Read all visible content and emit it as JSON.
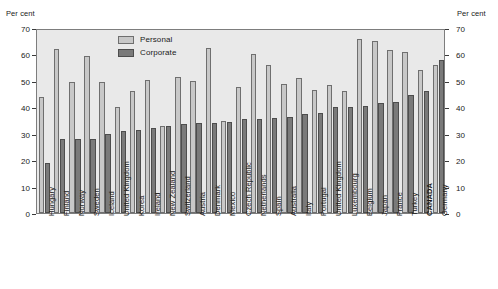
{
  "axis": {
    "unit_label_left": "Per cent",
    "unit_label_right": "Per cent",
    "ticks": [
      0,
      10,
      20,
      30,
      40,
      50,
      60,
      70
    ]
  },
  "legend": {
    "entries": [
      {
        "label": "Personal",
        "color": "#c8c8c8",
        "key": "personal"
      },
      {
        "label": "Corporate",
        "color": "#7a7a7a",
        "key": "corporate"
      }
    ]
  },
  "chart_data": {
    "type": "bar",
    "title": "",
    "subtitle": "",
    "xlabel": "",
    "ylabel": "Per cent",
    "ylim": [
      0,
      70
    ],
    "yticks": [
      0,
      10,
      20,
      30,
      40,
      50,
      60,
      70
    ],
    "grid": false,
    "legend_position": "top-center",
    "highlight_category": "CANADA",
    "categories": [
      "Hungary",
      "Finland",
      "Norway",
      "Sweden",
      "Iceland",
      "United Kingdom",
      "Korea",
      "Ireland",
      "New Zealand",
      "Switzerland",
      "Austria",
      "Denmark",
      "Mexico",
      "Czech Republic",
      "Netherlands",
      "Spain",
      "Australia",
      "Italy",
      "Portugal",
      "United Kingdom",
      "Luxembourg",
      "Belgium",
      "Japan",
      "France",
      "Turkey",
      "CANADA",
      "Germany"
    ],
    "series": [
      {
        "name": "Personal",
        "color": "#c8c8c8",
        "values": [
          44.0,
          62.0,
          49.5,
          59.5,
          49.5,
          40.0,
          46.0,
          50.5,
          33.0,
          51.5,
          50.0,
          62.5,
          35.0,
          47.5,
          60.0,
          56.0,
          49.0,
          51.0,
          46.5,
          48.5,
          46.0,
          66.0,
          65.0,
          61.5,
          61.0,
          54.0,
          56.0
        ]
      },
      {
        "name": "Corporate",
        "color": "#7a7a7a",
        "values": [
          19.0,
          28.0,
          28.0,
          28.0,
          30.0,
          31.0,
          31.5,
          32.0,
          33.0,
          33.5,
          34.0,
          34.0,
          34.5,
          35.5,
          35.5,
          36.0,
          36.5,
          37.5,
          38.0,
          40.0,
          40.0,
          40.5,
          41.5,
          42.0,
          44.5,
          46.0,
          58.0
        ]
      }
    ]
  }
}
